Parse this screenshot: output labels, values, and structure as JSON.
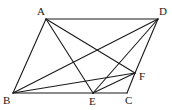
{
  "diagram": {
    "type": "geometry",
    "points": [
      {
        "name": "A",
        "x": 46,
        "y": 19,
        "label_x": 37,
        "label_y": 15
      },
      {
        "name": "D",
        "x": 158,
        "y": 19,
        "label_x": 159,
        "label_y": 15
      },
      {
        "name": "B",
        "x": 13,
        "y": 93,
        "label_x": 3,
        "label_y": 104
      },
      {
        "name": "E",
        "x": 93,
        "y": 93,
        "label_x": 89,
        "label_y": 105
      },
      {
        "name": "C",
        "x": 127,
        "y": 93,
        "label_x": 125,
        "label_y": 104
      },
      {
        "name": "F",
        "x": 135,
        "y": 73,
        "label_x": 139,
        "label_y": 80
      }
    ],
    "segments": [
      [
        "A",
        "D"
      ],
      [
        "A",
        "B"
      ],
      [
        "D",
        "F"
      ],
      [
        "F",
        "C"
      ],
      [
        "B",
        "E"
      ],
      [
        "E",
        "C"
      ],
      [
        "A",
        "E"
      ],
      [
        "A",
        "F"
      ],
      [
        "B",
        "D"
      ],
      [
        "B",
        "F"
      ],
      [
        "E",
        "D"
      ],
      [
        "E",
        "F"
      ]
    ],
    "stroke_color": "#1a1a1a"
  }
}
